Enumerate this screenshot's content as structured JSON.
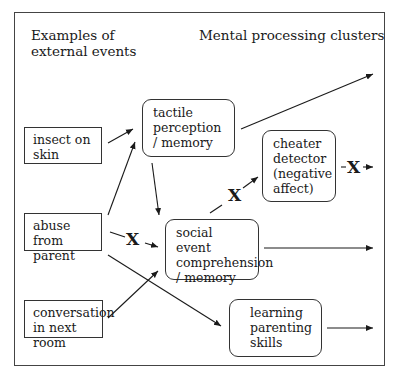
{
  "headings": {
    "left": [
      "Examples of",
      "external events"
    ],
    "right": "Mental processing clusters"
  },
  "events": [
    {
      "id": "insect",
      "lines": [
        "insect on",
        "skin"
      ]
    },
    {
      "id": "abuse",
      "lines": [
        "abuse from",
        "parent"
      ]
    },
    {
      "id": "conversation",
      "lines": [
        "conversation",
        "in next room"
      ]
    }
  ],
  "clusters": [
    {
      "id": "tactile",
      "lines": [
        "tactile",
        "perception",
        "/ memory"
      ]
    },
    {
      "id": "cheater",
      "lines": [
        "cheater",
        "detector",
        "(negative",
        "affect)"
      ]
    },
    {
      "id": "social",
      "lines": [
        "social event",
        "comprehension",
        "/ memory"
      ]
    },
    {
      "id": "learning",
      "lines": [
        "learning",
        "parenting",
        "skills"
      ]
    }
  ],
  "blocked_marks": [
    "X",
    "X",
    "X"
  ],
  "edges": [
    {
      "from": "insect",
      "to": "tactile",
      "blocked": false
    },
    {
      "from": "abuse",
      "to": "tactile",
      "blocked": false
    },
    {
      "from": "abuse",
      "to": "social",
      "blocked": true
    },
    {
      "from": "abuse",
      "to": "learning",
      "blocked": false
    },
    {
      "from": "conversation",
      "to": "social",
      "blocked": false
    },
    {
      "from": "tactile",
      "to": "social",
      "blocked": false
    },
    {
      "from": "tactile",
      "to": "output",
      "blocked": false
    },
    {
      "from": "social",
      "to": "cheater",
      "blocked": true
    },
    {
      "from": "social",
      "to": "output",
      "blocked": false
    },
    {
      "from": "cheater",
      "to": "output",
      "blocked": true
    },
    {
      "from": "learning",
      "to": "output",
      "blocked": false
    }
  ]
}
